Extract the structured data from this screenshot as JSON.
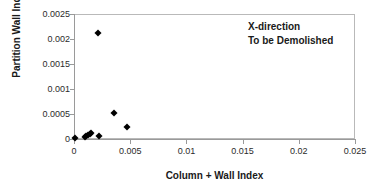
{
  "chart_data": {
    "type": "scatter",
    "title": "",
    "xlabel": "Column + Wall Index",
    "ylabel": "Partition Wall Index",
    "xlim": [
      0,
      0.025
    ],
    "ylim": [
      0,
      0.0025
    ],
    "grid": false,
    "legend": "none",
    "annotations": [
      "X-direction",
      "To be Demolished"
    ],
    "xticks": [
      "0",
      "0.005",
      "0.01",
      "0.015",
      "0.02",
      "0.025"
    ],
    "xtick_values": [
      0,
      0.005,
      0.01,
      0.015,
      0.02,
      0.025
    ],
    "yticks": [
      "0",
      "0.0005",
      "0.001",
      "0.0015",
      "0.002",
      "0.0025"
    ],
    "ytick_values": [
      0,
      0.0005,
      0.001,
      0.0015,
      0.002,
      0.0025
    ],
    "marker": "diamond",
    "marker_color": "#000000",
    "series": [
      {
        "name": "X-direction (To be Demolished)",
        "points": [
          {
            "x": 5e-05,
            "y": 2e-05
          },
          {
            "x": 0.00095,
            "y": 4e-05
          },
          {
            "x": 0.0011,
            "y": 6e-05
          },
          {
            "x": 0.00125,
            "y": 8e-05
          },
          {
            "x": 0.0014,
            "y": 0.0001
          },
          {
            "x": 0.00155,
            "y": 0.00012
          },
          {
            "x": 0.00225,
            "y": 6e-05
          },
          {
            "x": 0.00215,
            "y": 0.00212
          },
          {
            "x": 0.00355,
            "y": 0.00053
          },
          {
            "x": 0.0047,
            "y": 0.00025
          }
        ]
      }
    ]
  }
}
